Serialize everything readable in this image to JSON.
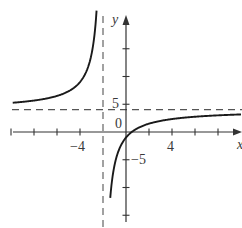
{
  "chart_data": {
    "type": "line",
    "title": "",
    "xlabel": "x",
    "ylabel": "y",
    "x_tick_labels": [
      "-4",
      "4"
    ],
    "y_tick_labels": [
      "5",
      "-5"
    ],
    "origin_label": "0",
    "x_ticks": [
      -10,
      -8,
      -6,
      -4,
      -2,
      2,
      4,
      6,
      8
    ],
    "y_ticks": [
      15,
      10,
      5,
      -5,
      -10,
      -15
    ],
    "xlim": [
      -10,
      10
    ],
    "ylim": [
      -16,
      21
    ],
    "asymptotes": {
      "vertical": -2,
      "horizontal": 4
    },
    "function": "y = 4 - 10/(x + 2)",
    "series": [
      {
        "name": "left-branch",
        "x": [
          -10,
          -8,
          -6,
          -4.5,
          -3.5,
          -3,
          -2.7,
          -2.55
        ],
        "y": [
          5.25,
          5.67,
          6.5,
          8.0,
          10.67,
          14.0,
          18.3,
          22.2
        ]
      },
      {
        "name": "right-branch",
        "x": [
          -1.5,
          -1.2,
          -1,
          -0.5,
          0,
          0.5,
          2,
          4,
          6,
          8,
          10
        ],
        "y": [
          -16,
          -8.5,
          -6,
          -2.67,
          -1,
          0,
          1.5,
          2.33,
          2.75,
          3.0,
          3.17
        ]
      }
    ],
    "grid": false,
    "legend": null
  },
  "labels": {
    "x_axis": "x",
    "y_axis": "y",
    "origin": "0",
    "x_neg4": "−4",
    "x_pos4": "4",
    "y_pos5": "5",
    "y_neg5": "−5"
  }
}
